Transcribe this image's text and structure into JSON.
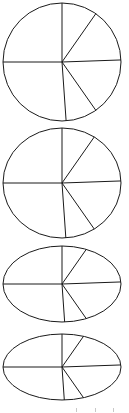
{
  "figure": {
    "canvas": {
      "width": 129,
      "height": 413
    },
    "background_color": "#ffffff",
    "stroke_color": "#1a1a1a",
    "fill_color": "#ffffff",
    "stroke_width": 1,
    "shape_count": 4,
    "spoke_count": 6,
    "sector_count": 6
  },
  "spoke_angles_deg": [
    90,
    55,
    2,
    -55,
    -86,
    180
  ],
  "sector_spans_deg": [
    35,
    53,
    57,
    31,
    86,
    98
  ],
  "shapes": [
    {
      "name": "circle-1",
      "label": "Shape 1",
      "cx": 62,
      "cy": 62,
      "rx": 59,
      "ry": 59,
      "flattening": 1.0,
      "kind": "circle"
    },
    {
      "name": "ellipse-2",
      "label": "Shape 2",
      "cx": 62,
      "cy": 183,
      "rx": 59,
      "ry": 55,
      "flattening": 0.93,
      "kind": "ellipse"
    },
    {
      "name": "ellipse-3",
      "label": "Shape 3",
      "cx": 62,
      "cy": 284,
      "rx": 59,
      "ry": 38,
      "flattening": 0.64,
      "kind": "ellipse"
    },
    {
      "name": "ellipse-4",
      "label": "Shape 4",
      "cx": 62,
      "cy": 367,
      "rx": 59,
      "ry": 33,
      "flattening": 0.56,
      "kind": "ellipse"
    }
  ],
  "tick_marks": {
    "name": "bottom-tick-marks",
    "visible": true,
    "color": "#c8c8c8",
    "y": 408,
    "width": 1,
    "height": 4,
    "x_positions": [
      76,
      95,
      113
    ]
  }
}
